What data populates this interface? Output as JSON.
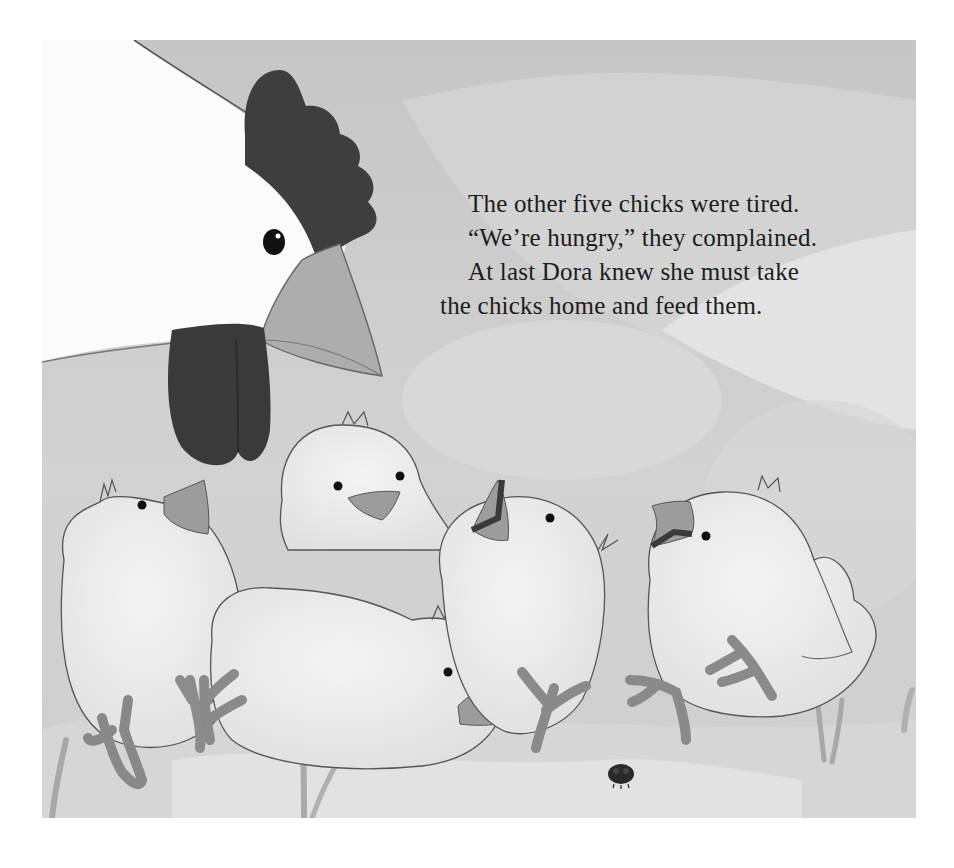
{
  "page": {
    "type": "picture-book-page",
    "story": {
      "lines": [
        "The other five chicks were tired.",
        "“We’re hungry,” they complained.",
        "At last Dora knew she must take",
        "the chicks home and feed them."
      ]
    },
    "illustration": {
      "subjects": [
        "hen-head",
        "chick-1",
        "chick-2",
        "chick-3",
        "chick-4",
        "chick-5",
        "ladybug"
      ],
      "palette": {
        "background": "#c9c9c9",
        "background_light": "#dedede",
        "hen_white": "#fbfbfb",
        "comb_wattle": "#3e3e3e",
        "beak": "#a9a9a9",
        "chick_body": "#ececec",
        "chick_beak": "#9c9c9c",
        "outline": "#4a4a4a",
        "ladybug": "#2a2a2a"
      }
    }
  }
}
